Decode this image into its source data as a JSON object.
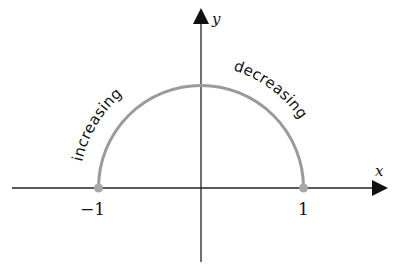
{
  "diagram": {
    "type": "semicircle-on-axes",
    "axes": {
      "x_label": "x",
      "y_label": "y"
    },
    "ticks": [
      {
        "value": -1,
        "label": "−1"
      },
      {
        "value": 1,
        "label": "1"
      }
    ],
    "curve": {
      "domain": [
        -1,
        1
      ],
      "radius": 1,
      "color": "#9a9a9a",
      "endpoint_color": "#a8a8a8"
    },
    "annotations": [
      {
        "id": "increasing",
        "text": "increasing",
        "side": "left"
      },
      {
        "id": "decreasing",
        "text": "decreasing",
        "side": "right"
      }
    ],
    "colors": {
      "axis": "#222222",
      "text": "#111111",
      "background": "#ffffff"
    }
  }
}
